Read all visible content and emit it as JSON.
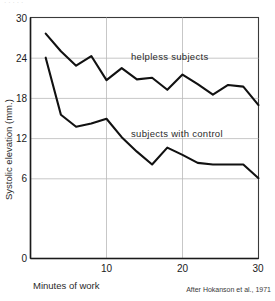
{
  "figure": {
    "credit": "After Hokanson et al., 1971",
    "top_cropped_text": "· ·  ·   ·    ·"
  },
  "chart_data": {
    "type": "line",
    "title": "",
    "subtitle": "",
    "xlabel": "Minutes of work",
    "ylabel": "Systolic elevation  (mm.)",
    "xlim": [
      0,
      30
    ],
    "ylim": [
      0,
      30
    ],
    "xticks": [
      "10",
      "20",
      "30"
    ],
    "xtick_values": [
      10,
      20,
      30
    ],
    "yticks": [
      "0",
      "6",
      "12",
      "18",
      "24",
      "30"
    ],
    "ytick_values": [
      0,
      6,
      12,
      18,
      24,
      30
    ],
    "grid": "horizontal-and-vertical",
    "legend_position": "inline-annotations",
    "annotations": [
      {
        "label": "helpless subjects",
        "x": 19.5,
        "y": 24.4
      },
      {
        "label": "subjects with control",
        "x": 20.5,
        "y": 15.6
      }
    ],
    "series": [
      {
        "name": "helpless subjects",
        "x": [
          2,
          4,
          6,
          8,
          10,
          12,
          14,
          16,
          18,
          20,
          22,
          24,
          26,
          28,
          30
        ],
        "values": [
          28.0,
          25.8,
          24.0,
          25.2,
          22.2,
          23.7,
          22.3,
          22.5,
          21.0,
          22.9,
          21.7,
          20.4,
          21.6,
          21.4,
          19.1
        ]
      },
      {
        "name": "subjects with control",
        "x": [
          2,
          4,
          6,
          8,
          10,
          12,
          14,
          16,
          18,
          20,
          22,
          24,
          26,
          28,
          30
        ],
        "values": [
          25.0,
          17.9,
          16.4,
          16.8,
          17.4,
          15.1,
          13.3,
          11.7,
          13.8,
          12.9,
          11.9,
          11.7,
          11.7,
          11.7,
          10.0
        ]
      }
    ]
  }
}
